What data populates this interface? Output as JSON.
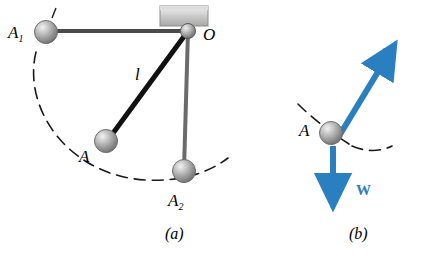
{
  "figure": {
    "panels": [
      {
        "key": "a",
        "label": "(a)"
      },
      {
        "key": "b",
        "label": "(b)"
      }
    ]
  },
  "panel_a": {
    "labels": {
      "A1_main": "A",
      "A1_sub": "1",
      "A2_main": "A",
      "A2_sub": "2",
      "A": "A",
      "O": "O",
      "length": "l"
    },
    "caption": "(a)"
  },
  "panel_b": {
    "labels": {
      "A": "A",
      "force_P": "P",
      "weight_W": "W"
    },
    "caption": "(b)"
  },
  "colors": {
    "vector_blue": "#2a7fc1",
    "rod_black": "#000000",
    "arc_black": "#000000",
    "ball_gray": "#9a9a9a",
    "bracket_gray": "#c8c8c8"
  }
}
